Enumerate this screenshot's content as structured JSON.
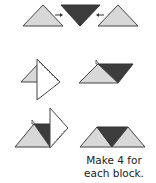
{
  "diagram": {
    "type": "quilt-assembly-instructions",
    "colors": {
      "light_fabric": "#d8d8d8",
      "dark_fabric": "#3c3c3c",
      "outline": "#444444",
      "folded_paper": "#ffffff"
    },
    "steps": [
      {
        "row": 1,
        "description": "Two light triangles and one dark inverted triangle, arrows pointing toward the center"
      },
      {
        "row": 2,
        "description": "Fold light triangle over; place dark triangle adjacent"
      },
      {
        "row": 3,
        "description": "Fold and join to form a unit of two light and one dark triangle"
      }
    ],
    "caption_line1": "Make 4 for",
    "caption_line2": "each block."
  }
}
